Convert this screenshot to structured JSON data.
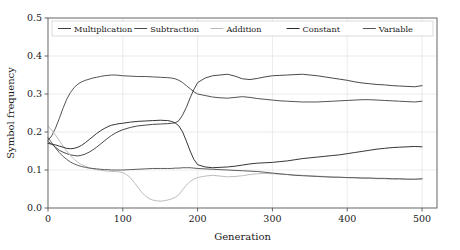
{
  "chart_data": {
    "type": "line",
    "title": "",
    "xlabel": "Generation",
    "ylabel": "Symbol frequency",
    "xlim": [
      0,
      520
    ],
    "ylim": [
      0.0,
      0.5
    ],
    "xticks": [
      0,
      100,
      200,
      300,
      400,
      500
    ],
    "xticklabels": [
      "0",
      "100",
      "200",
      "300",
      "400",
      "500"
    ],
    "yticks": [
      0.0,
      0.1,
      0.2,
      0.3,
      0.4,
      0.5
    ],
    "yticklabels": [
      "0.0",
      "0.1",
      "0.2",
      "0.3",
      "0.4",
      "0.5"
    ],
    "grid": true,
    "legend_position": "upper center",
    "legend_ncol": 5,
    "series": [
      {
        "name": "Multiplication",
        "color": "#3f3f3f",
        "x": [
          0,
          5,
          10,
          15,
          20,
          25,
          30,
          35,
          40,
          45,
          50,
          55,
          60,
          65,
          70,
          75,
          80,
          85,
          90,
          95,
          100,
          110,
          120,
          130,
          140,
          150,
          160,
          165,
          170,
          175,
          180,
          185,
          190,
          195,
          200,
          210,
          220,
          230,
          240,
          250,
          260,
          270,
          280,
          290,
          300,
          310,
          320,
          330,
          340,
          350,
          360,
          370,
          380,
          390,
          400,
          410,
          420,
          430,
          440,
          450,
          460,
          470,
          480,
          490,
          500
        ],
        "values": [
          0.175,
          0.168,
          0.16,
          0.152,
          0.147,
          0.143,
          0.14,
          0.138,
          0.137,
          0.139,
          0.142,
          0.147,
          0.153,
          0.16,
          0.168,
          0.176,
          0.184,
          0.191,
          0.197,
          0.202,
          0.206,
          0.212,
          0.216,
          0.218,
          0.22,
          0.221,
          0.222,
          0.223,
          0.224,
          0.23,
          0.245,
          0.265,
          0.29,
          0.312,
          0.33,
          0.342,
          0.348,
          0.35,
          0.352,
          0.347,
          0.34,
          0.338,
          0.341,
          0.345,
          0.348,
          0.349,
          0.35,
          0.351,
          0.352,
          0.35,
          0.348,
          0.345,
          0.342,
          0.339,
          0.336,
          0.332,
          0.329,
          0.327,
          0.325,
          0.324,
          0.322,
          0.321,
          0.32,
          0.319,
          0.322
        ]
      },
      {
        "name": "Subtraction",
        "color": "#4a4a4a",
        "x": [
          0,
          5,
          10,
          15,
          20,
          25,
          30,
          35,
          40,
          45,
          50,
          55,
          60,
          65,
          70,
          75,
          80,
          85,
          90,
          95,
          100,
          110,
          120,
          130,
          140,
          150,
          160,
          165,
          170,
          175,
          180,
          185,
          190,
          195,
          200,
          210,
          220,
          230,
          240,
          250,
          260,
          270,
          280,
          290,
          300,
          310,
          320,
          330,
          340,
          350,
          360,
          370,
          380,
          390,
          400,
          410,
          420,
          430,
          440,
          450,
          460,
          470,
          480,
          490,
          500
        ],
        "values": [
          0.178,
          0.19,
          0.21,
          0.235,
          0.262,
          0.286,
          0.304,
          0.317,
          0.326,
          0.332,
          0.336,
          0.339,
          0.342,
          0.344,
          0.346,
          0.348,
          0.349,
          0.35,
          0.35,
          0.349,
          0.348,
          0.347,
          0.346,
          0.346,
          0.345,
          0.344,
          0.343,
          0.342,
          0.34,
          0.336,
          0.33,
          0.322,
          0.314,
          0.306,
          0.3,
          0.296,
          0.292,
          0.29,
          0.289,
          0.291,
          0.293,
          0.291,
          0.288,
          0.286,
          0.284,
          0.282,
          0.281,
          0.28,
          0.279,
          0.279,
          0.279,
          0.28,
          0.281,
          0.282,
          0.283,
          0.284,
          0.285,
          0.285,
          0.284,
          0.283,
          0.282,
          0.281,
          0.28,
          0.279,
          0.281
        ]
      },
      {
        "name": "Addition",
        "color": "#b8b8b8",
        "x": [
          0,
          5,
          10,
          15,
          20,
          25,
          30,
          35,
          40,
          45,
          50,
          55,
          60,
          65,
          70,
          75,
          80,
          85,
          90,
          95,
          100,
          105,
          110,
          115,
          120,
          125,
          130,
          135,
          140,
          145,
          150,
          155,
          160,
          165,
          170,
          175,
          180,
          185,
          190,
          195,
          200,
          210,
          220,
          230,
          240,
          250,
          260,
          270,
          280,
          290,
          300,
          310,
          320,
          330,
          340,
          350,
          360,
          370,
          380,
          390,
          400,
          410,
          420,
          430,
          440,
          450,
          460,
          470,
          480,
          490,
          500
        ],
        "values": [
          0.215,
          0.205,
          0.192,
          0.178,
          0.163,
          0.15,
          0.138,
          0.128,
          0.12,
          0.114,
          0.11,
          0.106,
          0.103,
          0.101,
          0.099,
          0.098,
          0.097,
          0.096,
          0.096,
          0.095,
          0.093,
          0.088,
          0.08,
          0.068,
          0.055,
          0.042,
          0.032,
          0.025,
          0.021,
          0.019,
          0.018,
          0.019,
          0.021,
          0.024,
          0.028,
          0.035,
          0.048,
          0.06,
          0.07,
          0.076,
          0.08,
          0.084,
          0.086,
          0.084,
          0.082,
          0.083,
          0.085,
          0.088,
          0.09,
          0.091,
          0.09,
          0.089,
          0.088,
          0.087,
          0.086,
          0.085,
          0.084,
          0.083,
          0.082,
          0.081,
          0.08,
          0.079,
          0.078,
          0.078,
          0.077,
          0.077,
          0.076,
          0.076,
          0.075,
          0.075,
          0.076
        ]
      },
      {
        "name": "Constant",
        "color": "#2b2b2b",
        "x": [
          0,
          5,
          10,
          15,
          20,
          25,
          30,
          35,
          40,
          45,
          50,
          55,
          60,
          65,
          70,
          75,
          80,
          85,
          90,
          95,
          100,
          110,
          120,
          130,
          140,
          150,
          160,
          165,
          170,
          175,
          180,
          185,
          190,
          195,
          200,
          210,
          220,
          230,
          240,
          250,
          260,
          270,
          280,
          290,
          300,
          310,
          320,
          330,
          340,
          350,
          360,
          370,
          380,
          390,
          400,
          410,
          420,
          430,
          440,
          450,
          460,
          470,
          480,
          490,
          500
        ],
        "values": [
          0.17,
          0.168,
          0.166,
          0.163,
          0.16,
          0.157,
          0.156,
          0.157,
          0.16,
          0.165,
          0.172,
          0.18,
          0.188,
          0.196,
          0.203,
          0.209,
          0.214,
          0.218,
          0.22,
          0.222,
          0.223,
          0.226,
          0.228,
          0.229,
          0.23,
          0.231,
          0.23,
          0.228,
          0.224,
          0.216,
          0.2,
          0.176,
          0.15,
          0.128,
          0.114,
          0.108,
          0.106,
          0.107,
          0.108,
          0.11,
          0.113,
          0.116,
          0.118,
          0.119,
          0.12,
          0.122,
          0.124,
          0.127,
          0.13,
          0.132,
          0.134,
          0.136,
          0.138,
          0.14,
          0.143,
          0.146,
          0.149,
          0.152,
          0.155,
          0.157,
          0.159,
          0.16,
          0.161,
          0.162,
          0.161
        ]
      },
      {
        "name": "Variable",
        "color": "#555555",
        "x": [
          0,
          5,
          10,
          15,
          20,
          25,
          30,
          35,
          40,
          45,
          50,
          55,
          60,
          65,
          70,
          75,
          80,
          85,
          90,
          95,
          100,
          110,
          120,
          130,
          140,
          150,
          160,
          165,
          170,
          175,
          180,
          185,
          190,
          195,
          200,
          210,
          220,
          230,
          240,
          250,
          260,
          270,
          280,
          290,
          300,
          310,
          320,
          330,
          340,
          350,
          360,
          370,
          380,
          390,
          400,
          410,
          420,
          430,
          440,
          450,
          460,
          470,
          480,
          490,
          500
        ],
        "values": [
          0.185,
          0.172,
          0.158,
          0.146,
          0.136,
          0.128,
          0.121,
          0.116,
          0.112,
          0.109,
          0.107,
          0.105,
          0.104,
          0.103,
          0.102,
          0.101,
          0.101,
          0.1,
          0.1,
          0.1,
          0.1,
          0.101,
          0.102,
          0.103,
          0.104,
          0.104,
          0.104,
          0.104,
          0.105,
          0.105,
          0.106,
          0.106,
          0.106,
          0.105,
          0.104,
          0.103,
          0.102,
          0.101,
          0.1,
          0.099,
          0.098,
          0.097,
          0.096,
          0.094,
          0.092,
          0.09,
          0.088,
          0.086,
          0.085,
          0.084,
          0.083,
          0.082,
          0.081,
          0.081,
          0.08,
          0.08,
          0.079,
          0.079,
          0.078,
          0.078,
          0.077,
          0.077,
          0.076,
          0.076,
          0.077
        ]
      }
    ]
  }
}
